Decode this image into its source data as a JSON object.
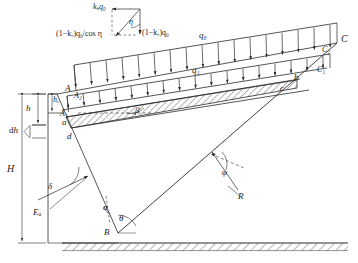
{
  "figure": {
    "domain": "engineering-diagram",
    "stroke_color": "#2b2b2b",
    "background": "#ffffff"
  },
  "labels": {
    "point_A": "A",
    "point_A2": "A₂",
    "point_A1": "A₁",
    "point_a": "a",
    "point_d": "d",
    "point_B": "B",
    "point_C": "C",
    "point_C2": "C₂",
    "point_C1": "C₁",
    "point_b": "b",
    "point_c": "c"
  },
  "dimensions": {
    "total_height": "H",
    "depth_h": "h",
    "element_thickness": "dh",
    "tension_crack_depth": "h",
    "tension_crack_sub": "c"
  },
  "angles": {
    "wall_inclination": "α",
    "failure_plane": "θ",
    "backfill_slope": "β",
    "wall_friction": "δ",
    "soil_friction": "φ",
    "seismic_inertia": "η"
  },
  "forces": {
    "active_thrust": "E",
    "active_thrust_sub": "a",
    "reaction": "R",
    "surcharge_top": "q₀",
    "surcharge_lower": "q₁"
  },
  "force_triangle": {
    "horizontal_component": "k",
    "horizontal_component_sub": "h",
    "horizontal_component_tail": "q₀",
    "vertical_component_prefix": "(1−k",
    "vertical_component_sub": "v",
    "vertical_component_tail": ")q₀",
    "resultant_prefix": "(1−k",
    "resultant_sub": "v",
    "resultant_tail": ")q₀/cos η",
    "angle": "η"
  },
  "annotations": {
    "ground_hatch": "ground-hatching",
    "soil_strip_hatch": "soil-element-hatching"
  }
}
